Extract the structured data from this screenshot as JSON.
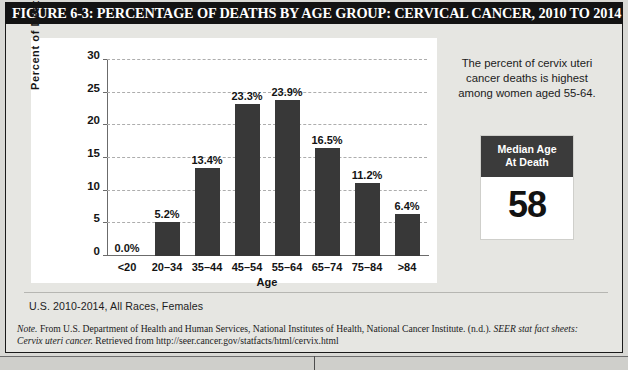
{
  "figure": {
    "title": "FIGURE 6-3: PERCENTAGE OF DEATHS BY AGE GROUP: CERVICAL CANCER, 2010 TO 2014",
    "caption": "U.S. 2010-2014, All Races, Females",
    "note_prefix": "Note.",
    "note_body_1": " From U.S. Department of Health and Human Services, National Institutes of Health, National Cancer Institute. (n.d.). ",
    "note_italic_1": "SEER stat fact sheets:",
    "note_italic_2": "Cervix uteri cancer.",
    "note_body_2": " Retrieved from http://seer.cancer.gov/statfacts/html/cervix.html"
  },
  "info_panel": {
    "description": "The percent of cervix uteri cancer deaths is highest among women aged 55-64.",
    "median_title_line1": "Median Age",
    "median_title_line2": "At Death",
    "median_value": "58"
  },
  "colors": {
    "bar": "#383838",
    "banner": "#131313",
    "card": "#ffffff",
    "background": "#e6e6e2",
    "gridline": "#adadad"
  },
  "chart_data": {
    "type": "bar",
    "title": "PERCENTAGE OF DEATHS BY AGE GROUP: CERVICAL CANCER, 2010 TO 2014",
    "xlabel": "Age",
    "ylabel": "Percent of Deaths",
    "categories": [
      "<20",
      "20–34",
      "35–44",
      "45–54",
      "55–64",
      "65–74",
      "75–84",
      ">84"
    ],
    "values": [
      0.0,
      5.2,
      13.4,
      23.3,
      23.9,
      16.5,
      11.2,
      6.4
    ],
    "data_labels": [
      "0.0%",
      "5.2%",
      "13.4%",
      "23.3%",
      "23.9%",
      "16.5%",
      "11.2%",
      "6.4%"
    ],
    "ylim": [
      0,
      30
    ],
    "yticks": [
      0,
      5,
      10,
      15,
      20,
      25,
      30
    ],
    "ytick_labels": [
      "0",
      "5",
      "10",
      "15",
      "20",
      "25",
      "30"
    ],
    "grid": true,
    "grid_axis": "y",
    "legend": false
  }
}
